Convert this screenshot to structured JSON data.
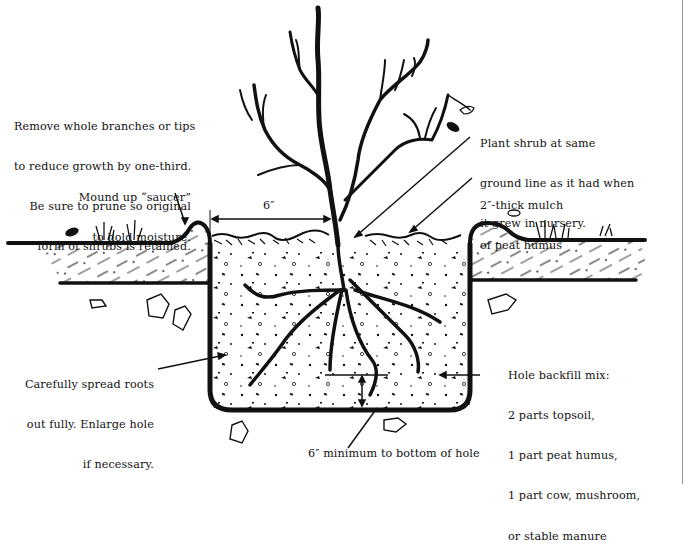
{
  "diagram": {
    "colors": {
      "ink": "#111111",
      "background": "#ffffff",
      "frame_line": "#9a9a9a"
    },
    "annotations": {
      "prune": {
        "lines": [
          "Remove whole branches or tips",
          "to reduce growth by one-third.",
          "Be sure to prune so original",
          "form of shrubs is retained."
        ]
      },
      "saucer": {
        "lines": [
          "Mound up “saucer”",
          "to hold moisture."
        ]
      },
      "ground_line": {
        "lines": [
          "Plant shrub at same",
          "ground line as it had when",
          "it grew in nursery."
        ]
      },
      "mulch": {
        "lines": [
          "2″-thick mulch",
          "of peat humus"
        ]
      },
      "roots": {
        "lines": [
          "Carefully spread roots",
          "out fully. Enlarge hole",
          "if necessary."
        ]
      },
      "backfill": {
        "lines": [
          "Hole backfill mix:",
          "2 parts topsoil,",
          "1 part peat humus,",
          "1 part cow, mushroom,",
          "or stable manure"
        ]
      },
      "bottom": {
        "lines": [
          "6″ minimum to bottom of hole"
        ]
      },
      "dimension": {
        "label": "6″"
      }
    }
  }
}
